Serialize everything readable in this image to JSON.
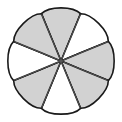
{
  "figure": {
    "shape_type": "rosette",
    "background_color": "#ffffff",
    "outline_color": "#1a1a1a",
    "outline_width": 1.6,
    "divider_color": "#5a5a5a",
    "divider_width": 0.9,
    "fill_gray": "#d2d2d2",
    "fill_white": "#ffffff",
    "center": {
      "x": 61,
      "y": 61
    },
    "petal_count": 8,
    "petal_length": 52,
    "petal_half_width_deg": 22.5,
    "petal_tip_radius": 20,
    "canvas": {
      "width": 122,
      "height": 122
    }
  },
  "petals": [
    {
      "index": 0,
      "label": "petal-top",
      "angle_deg": -90,
      "fill": "#d2d2d2",
      "fill_name": "gray"
    },
    {
      "index": 1,
      "label": "petal-top-right",
      "angle_deg": -45,
      "fill": "#ffffff",
      "fill_name": "white"
    },
    {
      "index": 2,
      "label": "petal-right",
      "angle_deg": 0,
      "fill": "#d2d2d2",
      "fill_name": "gray"
    },
    {
      "index": 3,
      "label": "petal-bottom-right",
      "angle_deg": 45,
      "fill": "#d2d2d2",
      "fill_name": "gray"
    },
    {
      "index": 4,
      "label": "petal-bottom",
      "angle_deg": 90,
      "fill": "#ffffff",
      "fill_name": "white"
    },
    {
      "index": 5,
      "label": "petal-bottom-left",
      "angle_deg": 135,
      "fill": "#d2d2d2",
      "fill_name": "gray"
    },
    {
      "index": 6,
      "label": "petal-left",
      "angle_deg": 180,
      "fill": "#ffffff",
      "fill_name": "white"
    },
    {
      "index": 7,
      "label": "petal-top-left",
      "angle_deg": -135,
      "fill": "#d2d2d2",
      "fill_name": "gray"
    }
  ]
}
